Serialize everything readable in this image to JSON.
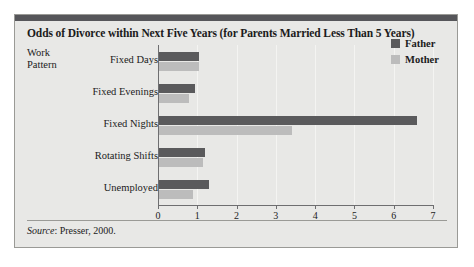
{
  "figure": {
    "title": "Odds of Divorce within Next Five Years (for Parents Married Less Than 5 Years)",
    "axis_title_line1": "Work",
    "axis_title_line2": "Pattern",
    "source_label": "Source",
    "source_separator": ": ",
    "source_text": "Presser, 2000.",
    "colors": {
      "father": "#5a5a5c",
      "mother": "#bcbcbc",
      "card_background": "#e8e8e6",
      "top_rule": "#56565a",
      "border": "#9a9a96",
      "gridline": "#f4f4f2",
      "axis": "#6e6e70",
      "text": "#1b1b1b"
    }
  },
  "chart_data": {
    "type": "bar",
    "orientation": "horizontal",
    "title": "Odds of Divorce within Next Five Years (for Parents Married Less Than 5 Years)",
    "xlabel": "",
    "ylabel": "Work Pattern",
    "xlim": [
      0,
      7
    ],
    "xticks": [
      0,
      1,
      2,
      3,
      4,
      5,
      6,
      7
    ],
    "xtick_labels": [
      "0",
      "1",
      "2",
      "3",
      "4",
      "5",
      "6",
      "7"
    ],
    "grid": true,
    "legend_position": "top-right",
    "categories": [
      "Fixed Days",
      "Fixed Evenings",
      "Fixed Nights",
      "Rotating Shifts",
      "Unemployed"
    ],
    "series": [
      {
        "name": "Father",
        "color": "#5a5a5c",
        "values": [
          1.05,
          0.95,
          6.6,
          1.2,
          1.3
        ]
      },
      {
        "name": "Mother",
        "color": "#bcbcbc",
        "values": [
          1.05,
          0.8,
          3.4,
          1.15,
          0.9
        ]
      }
    ]
  }
}
